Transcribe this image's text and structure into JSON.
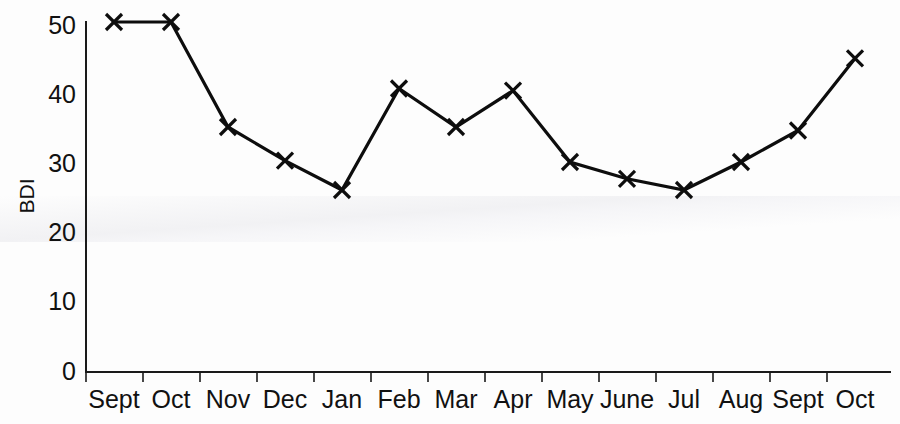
{
  "chart_data": {
    "type": "line",
    "title": "",
    "subtitle": "",
    "xlabel": "",
    "ylabel": "BDI",
    "categories": [
      "Sept",
      "Oct",
      "Nov",
      "Dec",
      "Jan",
      "Feb",
      "Mar",
      "Apr",
      "May",
      "June",
      "Jul",
      "Aug",
      "Sept",
      "Oct"
    ],
    "values": [
      50,
      50,
      35,
      30.2,
      26,
      40.5,
      35,
      40.2,
      30,
      27.6,
      26,
      30,
      34.5,
      44.8
    ],
    "series": [
      {
        "name": "BDI",
        "values": [
          50,
          50,
          35,
          30.2,
          26,
          40.5,
          35,
          40.2,
          30,
          27.6,
          26,
          30,
          34.5,
          44.8
        ]
      }
    ],
    "ylim": [
      0,
      50
    ],
    "y_ticks": [
      0,
      10,
      20,
      30,
      40,
      50
    ],
    "y_tick_labels": [
      "0",
      "10",
      "20",
      "30",
      "40",
      "50"
    ],
    "x_tick_labels": [
      "Sept",
      "Oct",
      "Nov",
      "Dec",
      "Jan",
      "Feb",
      "Mar",
      "Apr",
      "May",
      "June",
      "Jul",
      "Aug",
      "Sept",
      "Oct"
    ],
    "grid": false,
    "legend": false,
    "legend_position": "none",
    "marker": "x",
    "line_color": "#0d0d0d",
    "axis_color": "#1a1a1a",
    "background_color": "#ffffff",
    "annotations": []
  }
}
